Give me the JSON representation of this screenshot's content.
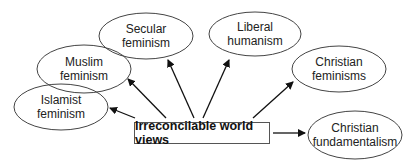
{
  "center": {
    "label": "Irreconcilable world views",
    "x": 134,
    "y": 122,
    "w": 136,
    "h": 22
  },
  "nodes": [
    {
      "id": "islamist-feminism",
      "line1": "Islamist",
      "line2": "feminism",
      "cx": 61,
      "cy": 107,
      "rx": 47,
      "ry": 23
    },
    {
      "id": "muslim-feminism",
      "line1": "Muslim",
      "line2": "feminism",
      "cx": 84,
      "cy": 69,
      "rx": 47,
      "ry": 24
    },
    {
      "id": "secular-feminism",
      "line1": "Secular",
      "line2": "feminism",
      "cx": 146,
      "cy": 36,
      "rx": 47,
      "ry": 23
    },
    {
      "id": "liberal-humanism",
      "line1": "Liberal",
      "line2": "humanism",
      "cx": 255,
      "cy": 34,
      "rx": 46,
      "ry": 22
    },
    {
      "id": "christian-feminisms",
      "line1": "Christian",
      "line2": "feminisms",
      "cx": 339,
      "cy": 69,
      "rx": 47,
      "ry": 23
    },
    {
      "id": "christian-fundamentalism",
      "line1": "Christian",
      "line2": "fundamentalism",
      "cx": 355,
      "cy": 135,
      "rx": 47,
      "ry": 24
    }
  ],
  "arrows": [
    {
      "to": "islamist-feminism",
      "x1": 135,
      "y1": 118,
      "x2": 110,
      "y2": 108
    },
    {
      "to": "muslim-feminism",
      "x1": 166,
      "y1": 118,
      "x2": 128,
      "y2": 79
    },
    {
      "to": "secular-feminism",
      "x1": 194,
      "y1": 118,
      "x2": 168,
      "y2": 60
    },
    {
      "to": "liberal-humanism",
      "x1": 203,
      "y1": 118,
      "x2": 229,
      "y2": 60
    },
    {
      "to": "christian-feminisms",
      "x1": 253,
      "y1": 118,
      "x2": 293,
      "y2": 82
    },
    {
      "to": "christian-fundamentalism",
      "x1": 273,
      "y1": 133,
      "x2": 305,
      "y2": 133
    }
  ]
}
